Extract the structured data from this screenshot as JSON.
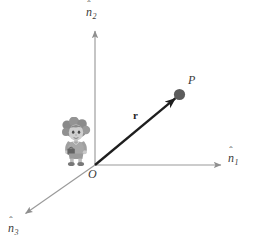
{
  "figure": {
    "background_color": "#ffffff",
    "width": 259,
    "height": 247
  },
  "axes": [
    {
      "id": "n2",
      "name": "vertical-axis",
      "symbol": "n",
      "hat": "ˆ",
      "subscript": "2",
      "label_plain": "n̂2",
      "color": "#9a9a9a",
      "from": [
        95,
        165
      ],
      "to": [
        95,
        28
      ],
      "direction": "up"
    },
    {
      "id": "n1",
      "name": "horizontal-axis",
      "symbol": "n",
      "hat": "ˆ",
      "subscript": "1",
      "label_plain": "n̂1",
      "color": "#9a9a9a",
      "from": [
        95,
        165
      ],
      "to": [
        224,
        165
      ],
      "direction": "right"
    },
    {
      "id": "n3",
      "name": "depth-axis",
      "symbol": "n",
      "hat": "ˆ",
      "subscript": "3",
      "label_plain": "n̂3",
      "color": "#9a9a9a",
      "from": [
        95,
        165
      ],
      "to": [
        22,
        216
      ],
      "direction": "down-left"
    }
  ],
  "origin": {
    "label": "O",
    "position": [
      95,
      165
    ],
    "color": "#3a3a3a"
  },
  "point": {
    "label": "P",
    "position": [
      179,
      95
    ],
    "marker": "filled-circle",
    "marker_radius": 5.5,
    "color": "#5c5c5c",
    "label_color": "#3a3a3a"
  },
  "vector": {
    "label": "r",
    "label_style": "bold",
    "from": [
      95,
      165
    ],
    "to": [
      179,
      95
    ],
    "color": "#1e1e1e",
    "arrowhead": true,
    "label_position": [
      133,
      110
    ]
  },
  "observer": {
    "name": "cartoon-observer",
    "description": "cartoon person with curly hair standing near the origin",
    "position": [
      58,
      117
    ],
    "size": [
      36,
      50
    ],
    "colors": {
      "hair": "#8d8d8d",
      "skin": "#c9c9c9",
      "clothes": "#a5a5a5",
      "outline": "#6b6b6b"
    }
  },
  "colors": {
    "axis": "#9a9a9a",
    "vector": "#1e1e1e",
    "point": "#5c5c5c",
    "text": "#3a3a3a",
    "background": "#ffffff"
  }
}
